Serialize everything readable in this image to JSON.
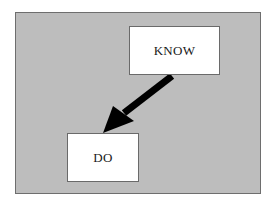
{
  "diagram": {
    "type": "flow",
    "nodes": [
      {
        "id": "know",
        "label": "KNOW"
      },
      {
        "id": "do",
        "label": "DO"
      }
    ],
    "edges": [
      {
        "from": "know",
        "to": "do",
        "style": "thick-arrow"
      }
    ],
    "colors": {
      "background": "#bdbdbd",
      "box_fill": "#ffffff",
      "arrow": "#000000",
      "border": "#6e6e6e"
    }
  }
}
